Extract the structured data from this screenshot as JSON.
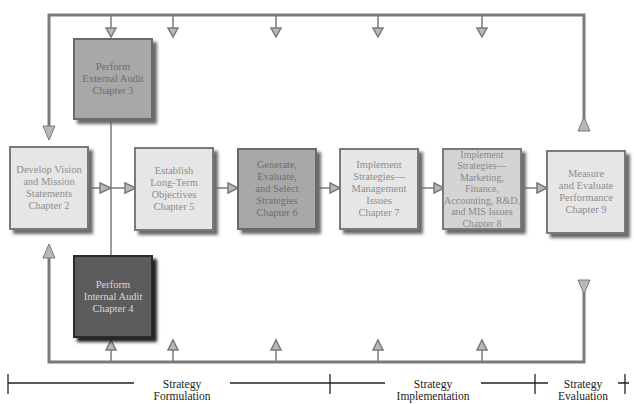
{
  "diagram": {
    "title_partial": "",
    "boxes": [
      {
        "id": "external-audit",
        "label": "Perform\nExternal Audit\nChapter 3",
        "shade": "mid"
      },
      {
        "id": "vision-mission",
        "label": "Develop Vision\nand Mission\nStatements\nChapter 2",
        "shade": "light"
      },
      {
        "id": "long-term-objectives",
        "label": "Establish\nLong-Term\nObjectives\nChapter 5",
        "shade": "light"
      },
      {
        "id": "generate-strategies",
        "label": "Generate,\nEvaluate,\nand Select\nStrategies\nChapter 6",
        "shade": "mid"
      },
      {
        "id": "implement-management",
        "label": "Implement\nStrategies—\nManagement\nIssues\nChapter 7",
        "shade": "light"
      },
      {
        "id": "implement-functional",
        "label": "Implement\nStrategies—\nMarketing,\nFinance,\nAccounting, R&D,\nand MIS Issues\nChapter 8",
        "shade": "mid2"
      },
      {
        "id": "measure-evaluate",
        "label": "Measure\nand Evaluate\nPerformance\nChapter 9",
        "shade": "light"
      },
      {
        "id": "internal-audit",
        "label": "Perform\nInternal Audit\nChapter 4",
        "shade": "dark"
      }
    ],
    "phases": [
      {
        "label": "Strategy\nFormulation"
      },
      {
        "label": "Strategy\nImplementation"
      },
      {
        "label": "Strategy\nEvaluation"
      }
    ],
    "colors": {
      "line": "#7a7a7a",
      "arrow_fill": "#b0b0b0",
      "phase_line": "#222222"
    }
  }
}
